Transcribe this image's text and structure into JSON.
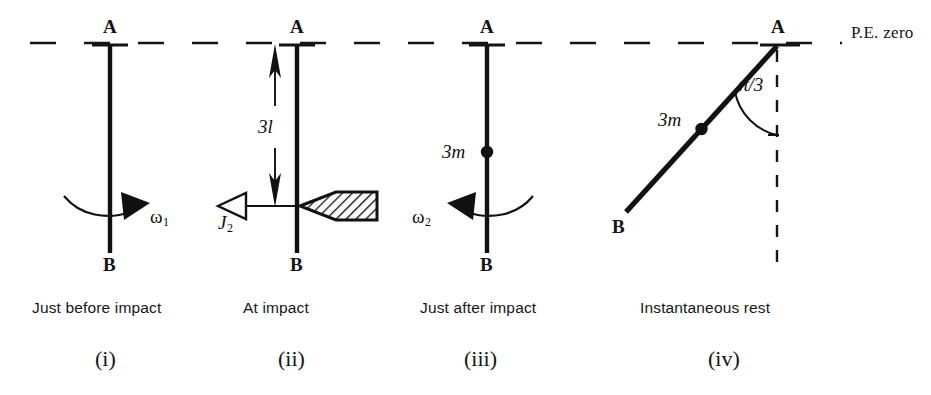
{
  "figure": {
    "title_note": "P.E. zero",
    "pe_zero_label": "P.E. zero",
    "background_color": "#ffffff",
    "ink_color": "#111111"
  },
  "panels": [
    {
      "id": "i",
      "numeral": "(i)",
      "caption": "Just before impact",
      "top_label": "A",
      "bottom_label": "B",
      "angular_velocity_label": "ω",
      "angular_velocity_sub": "1",
      "rotation_sense": "clockwise"
    },
    {
      "id": "ii",
      "numeral": "(ii)",
      "caption": "At impact",
      "top_label": "A",
      "bottom_label": "B",
      "dimension_label": "3l",
      "impulse_label": "J",
      "impulse_sub": "2",
      "impulse_direction": "left",
      "striker": "hatched-wedge"
    },
    {
      "id": "iii",
      "numeral": "(iii)",
      "caption": "Just after impact",
      "top_label": "A",
      "bottom_label": "B",
      "mass_label": "3m",
      "angular_velocity_label": "ω",
      "angular_velocity_sub": "2",
      "rotation_sense": "counter-clockwise"
    },
    {
      "id": "iv",
      "numeral": "(iv)",
      "caption": "Instantaneous rest",
      "top_label": "A",
      "bottom_label": "B",
      "mass_label": "3m",
      "angle_label": "π/3",
      "angle_value_radians": "π/3",
      "reference_line": "vertical-dashed"
    }
  ],
  "geometry": {
    "pe_line_y": 43,
    "rod_x_positions": [
      110,
      297,
      487
    ],
    "rod_top_y": 45,
    "rod_bottom_y": 253,
    "tilted_rod": {
      "ax": 777,
      "ay": 46,
      "bx": 626,
      "by": 212
    }
  }
}
